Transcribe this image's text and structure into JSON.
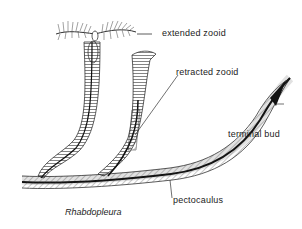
{
  "figure": {
    "title": "Rhabdopleura",
    "labels": [
      {
        "id": "extended-zooid",
        "text": "extended zooid"
      },
      {
        "id": "retracted-zooid",
        "text": "retracted zooid"
      },
      {
        "id": "terminal-bud",
        "text": "terminal bud"
      },
      {
        "id": "pectocaulus",
        "text": "pectocaulus"
      }
    ]
  },
  "colors": {
    "ink": "#222222",
    "background": "#ffffff"
  }
}
